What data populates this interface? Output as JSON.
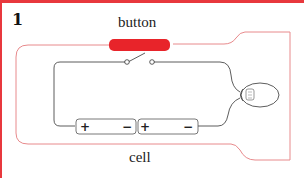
{
  "figure": {
    "number": "1",
    "labels": {
      "button": "button",
      "cell": "cell"
    },
    "components": [
      {
        "name": "push-button-switch",
        "label": "button"
      },
      {
        "name": "battery-cell-1",
        "terminals": [
          "+",
          "−"
        ]
      },
      {
        "name": "battery-cell-2",
        "terminals": [
          "+",
          "−"
        ]
      },
      {
        "name": "bulb"
      }
    ],
    "colors": {
      "frame": "#e8383d",
      "button": "#e8242a",
      "casing_outline": "#e88a8c",
      "wire": "#333333"
    }
  }
}
